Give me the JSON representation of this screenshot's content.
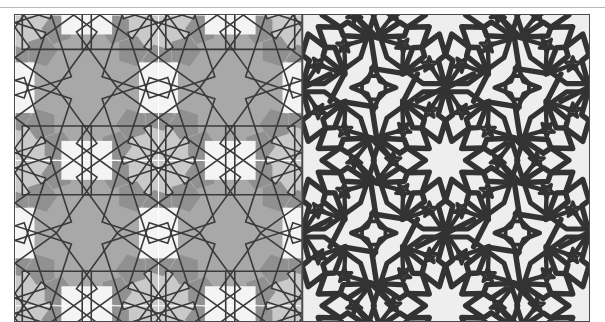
{
  "figure": {
    "domain_type": "diagram",
    "panel_count": 2,
    "border_color": "#4a4a4a",
    "page_background": "#ffffff",
    "top_rule_color": "#b9b9b9"
  },
  "panels": [
    {
      "id": "construction",
      "name": "construction-panel",
      "position": "left",
      "background_color": "#a8a8a8",
      "line_color": "#3a3a3a",
      "fill_light": "#c9c9c9",
      "fill_lighter": "#e4e4e4",
      "fill_white": "#f4f4f4",
      "fill_dark": "#8e8e8e",
      "guide_line_color": "#ffffff",
      "guide_lines": {
        "vertical_x_pct": 50,
        "horizontal_y_pct": 47.5
      },
      "motif": "overlapping-tilted-squares",
      "symmetry_order": 10,
      "rosette_centers_pct": [
        {
          "x": 0,
          "y": 0
        },
        {
          "x": 50,
          "y": 0
        },
        {
          "x": 100,
          "y": 0
        },
        {
          "x": 0,
          "y": 47.5
        },
        {
          "x": 50,
          "y": 47.5
        },
        {
          "x": 100,
          "y": 47.5
        },
        {
          "x": 0,
          "y": 95
        },
        {
          "x": 50,
          "y": 95
        },
        {
          "x": 100,
          "y": 95
        }
      ],
      "squares_per_rosette": 10,
      "square_stroke_width": 1.6
    },
    {
      "id": "finished",
      "name": "finished-panel",
      "position": "right",
      "background_color": "#eeeeee",
      "strap_color": "#333333",
      "strap_width": 5.5,
      "motif": "interlaced-strapwork-rosette",
      "symmetry_order": 10,
      "rosette_centers_pct": [
        {
          "x": 0,
          "y": 0
        },
        {
          "x": 50,
          "y": 0
        },
        {
          "x": 100,
          "y": 0
        },
        {
          "x": 0,
          "y": 47.5
        },
        {
          "x": 50,
          "y": 47.5
        },
        {
          "x": 100,
          "y": 47.5
        },
        {
          "x": 0,
          "y": 95
        },
        {
          "x": 50,
          "y": 95
        },
        {
          "x": 100,
          "y": 95
        }
      ],
      "center_star_points": 10,
      "secondary_star_points": 5
    }
  ],
  "geometry": {
    "tile_width_pct": 50,
    "tile_height_pct": 47.5,
    "rosette_outer_radius_pct": 26,
    "rosette_inner_radius_pct": 9,
    "square_half_diagonal_pct": 17
  }
}
